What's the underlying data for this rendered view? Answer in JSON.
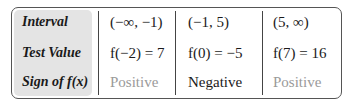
{
  "table": {
    "row_labels": [
      "Interval",
      "Test Value",
      "Sign of f(x)"
    ],
    "columns": [
      {
        "interval": "(−∞, −1)",
        "test_value": "f(−2) = 7",
        "sign": "Positive"
      },
      {
        "interval": "(−1, 5)",
        "test_value": "f(0) = −5",
        "sign": "Negative"
      },
      {
        "interval": "(5, ∞)",
        "test_value": "f(7) = 16",
        "sign": "Positive"
      }
    ]
  },
  "colors": {
    "label_panel": "#e4e4e4",
    "positive_text": "#9a9a9a",
    "border": "#555555"
  }
}
